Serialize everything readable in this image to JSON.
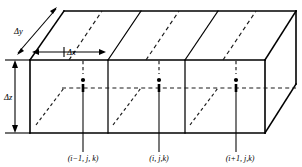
{
  "figure": {
    "colors": {
      "line": "#000000",
      "hidden_line": "#1a1a1a",
      "background": "#ffffff"
    }
  },
  "dimensions": {
    "depth": {
      "symbol": "Δy",
      "name": "delta-y",
      "orientation": "oblique-depth"
    },
    "width": {
      "symbol": "Δx",
      "name": "delta-x",
      "orientation": "horizontal"
    },
    "height": {
      "symbol": "Δz",
      "name": "delta-z",
      "orientation": "vertical"
    }
  },
  "nodes": [
    {
      "label": "(i−1, j, k)",
      "name": "node-i-minus-1",
      "cell": 1,
      "dot_x": 83,
      "dot_y": 80,
      "label_x": 83
    },
    {
      "label": "(i, j,k)",
      "name": "node-i",
      "cell": 2,
      "dot_x": 159,
      "dot_y": 80,
      "label_x": 159
    },
    {
      "label": "(i+1, j,k)",
      "name": "node-i-plus-1",
      "cell": 3,
      "dot_x": 236,
      "dot_y": 80,
      "label_x": 240
    }
  ],
  "geometry": {
    "front_top_left": [
      30,
      60
    ],
    "front_top_right": [
      265,
      60
    ],
    "front_bottom_left": [
      30,
      133
    ],
    "front_bottom_right": [
      265,
      133
    ],
    "back_top_left": [
      64,
      11
    ],
    "back_top_right": [
      296,
      11
    ],
    "cell_boundaries_front_x": [
      30,
      108,
      185,
      265
    ],
    "top_face_rear_y": 11,
    "hidden_mid_line_y": 88
  }
}
